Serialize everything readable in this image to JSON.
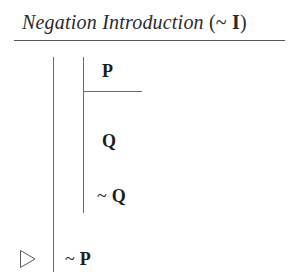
{
  "rule": {
    "name": "Negation Introduction",
    "abbrev_open_paren": "(",
    "abbrev_tilde": "~",
    "abbrev_letter": "I",
    "abbrev_close_paren": ")",
    "full_title": "Negation Introduction (~ I)"
  },
  "proof": {
    "lines": [
      {
        "id": "assumption",
        "tilde": "",
        "formula": "P",
        "depth": 2
      },
      {
        "id": "derived",
        "tilde": "",
        "formula": "Q",
        "depth": 2
      },
      {
        "id": "contradiction",
        "tilde": "~",
        "formula": "Q",
        "depth": 2
      },
      {
        "id": "conclusion",
        "tilde": "~",
        "formula": "P",
        "depth": 1
      }
    ],
    "conclusion_marker": "right-triangle-outline"
  },
  "colors": {
    "background": "#ffffff",
    "text": "#1d1d1d",
    "title_text": "#2b2b2b",
    "rule_line": "#555555",
    "scope_line": "#6a6a6a"
  }
}
